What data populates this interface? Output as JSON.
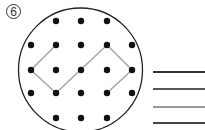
{
  "problem": {
    "number": "6",
    "board": {
      "circle": {
        "cx": 80.5,
        "cy": 70,
        "r": 62,
        "stroke": "#222222"
      },
      "dot_color": "#111111",
      "dot_radius": 3.2,
      "columns_x": [
        31,
        56,
        81,
        107,
        132
      ],
      "rows_y": [
        21,
        45,
        70,
        93,
        118
      ],
      "dots": [
        [
          56,
          21
        ],
        [
          81,
          21
        ],
        [
          107,
          21
        ],
        [
          31,
          45
        ],
        [
          56,
          45
        ],
        [
          81,
          45
        ],
        [
          107,
          45
        ],
        [
          132,
          45
        ],
        [
          31,
          70
        ],
        [
          56,
          70
        ],
        [
          81,
          70
        ],
        [
          107,
          70
        ],
        [
          132,
          70
        ],
        [
          31,
          93
        ],
        [
          56,
          93
        ],
        [
          81,
          93
        ],
        [
          107,
          93
        ],
        [
          132,
          93
        ],
        [
          56,
          118
        ],
        [
          81,
          118
        ],
        [
          107,
          118
        ]
      ],
      "path": {
        "color": "#a8a8a8",
        "points": [
          [
            56,
            45
          ],
          [
            31,
            70
          ],
          [
            56,
            93
          ],
          [
            107,
            45
          ],
          [
            132,
            70
          ],
          [
            107,
            93
          ]
        ]
      }
    },
    "answer_lines": [
      {
        "y": 71,
        "color": "#333333"
      },
      {
        "y": 88,
        "color": "#555555"
      },
      {
        "y": 106,
        "color": "#999999"
      },
      {
        "y": 122,
        "color": "#444444"
      }
    ]
  }
}
